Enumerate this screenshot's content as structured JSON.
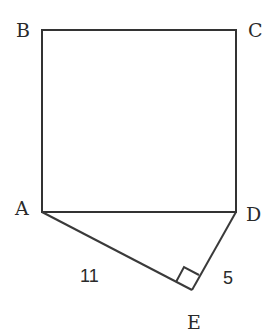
{
  "diagram": {
    "colors": {
      "line": "#333333",
      "text": "#2a2a2a",
      "background": "#ffffff"
    },
    "vertices": {
      "A": {
        "label": "A",
        "x": 42,
        "y": 212
      },
      "B": {
        "label": "B",
        "x": 42,
        "y": 30
      },
      "C": {
        "label": "C",
        "x": 236,
        "y": 30
      },
      "D": {
        "label": "D",
        "x": 236,
        "y": 212
      },
      "E": {
        "label": "E",
        "x": 192,
        "y": 290
      }
    },
    "segments": [
      {
        "from": "A",
        "to": "B"
      },
      {
        "from": "B",
        "to": "C"
      },
      {
        "from": "C",
        "to": "D"
      },
      {
        "from": "D",
        "to": "A"
      },
      {
        "from": "A",
        "to": "E",
        "length_label": "11"
      },
      {
        "from": "E",
        "to": "D",
        "length_label": "5"
      }
    ],
    "measurements": {
      "AE": "11",
      "ED": "5"
    },
    "right_angle_marker": "E"
  }
}
